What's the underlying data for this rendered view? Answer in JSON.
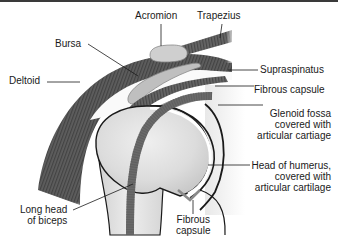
{
  "figure": {
    "colors": {
      "muscle_dark": "#5a5a5a",
      "muscle_stripe": "#3f3f3f",
      "bone_light": "#e6e6e6",
      "bone_shade": "#c9c9c9",
      "bursa": "#bdbdbd",
      "outline": "#1a1a1a",
      "capsule": "#7a7a7a"
    },
    "labels": {
      "acromion": "Acromion",
      "trapezius": "Trapezius",
      "bursa": "Bursa",
      "deltoid": "Deltoid",
      "supraspinatus": "Supraspinatus",
      "fibrous_capsule_top": "Fibrous capsule",
      "glenoid_fossa": "Glenoid fossa\ncovered with\narticular cartiage",
      "head_of_humerus": "Head of humerus,\ncovered with\narticular cartilage",
      "long_head_biceps": "Long head\nof biceps",
      "fibrous_capsule_bottom": "Fibrous\ncapsule"
    }
  }
}
